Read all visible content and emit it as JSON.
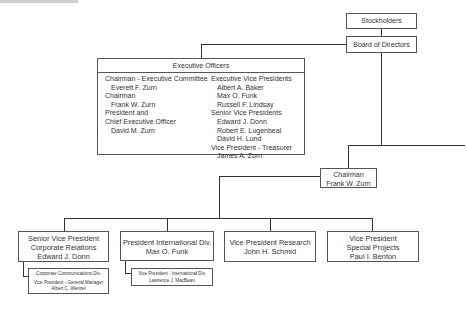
{
  "top": {
    "stockholders": "Stockholders",
    "board": "Board of Directors"
  },
  "executive_officers": {
    "title": "Executive Officers",
    "left_column": [
      {
        "text": "Chairman - Executive Committee",
        "indent": false
      },
      {
        "text": "Everett F. Zurn",
        "indent": true
      },
      {
        "text": "Chairman",
        "indent": false
      },
      {
        "text": "Frank W. Zurn",
        "indent": true
      },
      {
        "text": "President and",
        "indent": false
      },
      {
        "text": "Chief Executive Officer",
        "indent": false
      },
      {
        "text": "David M. Zurn",
        "indent": true
      }
    ],
    "right_column": [
      {
        "text": "Executive Vice Presidents",
        "indent": false
      },
      {
        "text": "Albert A. Baker",
        "indent": true
      },
      {
        "text": "Max O. Funk",
        "indent": true
      },
      {
        "text": "Russell F. Lindsay",
        "indent": true
      },
      {
        "text": "Senior Vice Presidents",
        "indent": false
      },
      {
        "text": "Edward J. Donn",
        "indent": true
      },
      {
        "text": "Robert E. Lugenbeal",
        "indent": true
      },
      {
        "text": "David H. Lund",
        "indent": true
      },
      {
        "text": "Vice President - Treasurer",
        "indent": false
      },
      {
        "text": "James A. Zurn",
        "indent": true
      }
    ]
  },
  "chairman": {
    "title": "Chairman",
    "name": "Frank W. Zurn"
  },
  "divisions": [
    {
      "lines": [
        "Senior Vice President",
        "Corporate Relations",
        "Edward J. Donn"
      ],
      "sub": {
        "lines": [
          "Corporate Communications Div.",
          "Vice President - General Manager",
          "Albert C. Wenzel"
        ]
      }
    },
    {
      "lines": [
        "President International Div.",
        "Max O. Funk"
      ],
      "sub": {
        "lines": [
          "Vice President - International Div.",
          "Lawrence J. MacBean"
        ]
      }
    },
    {
      "lines": [
        "Vice President Research",
        "John H. Schmid"
      ]
    },
    {
      "lines": [
        "Vice President",
        "Special Projects",
        "Paul I. Benton"
      ]
    }
  ]
}
